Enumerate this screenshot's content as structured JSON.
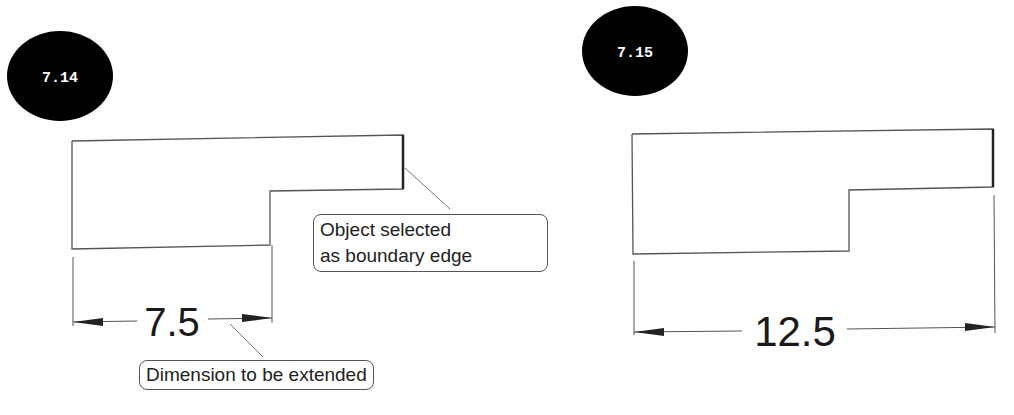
{
  "figures": [
    {
      "id_label": "7.14",
      "dimension_value": "7.5",
      "callouts": [
        {
          "text_lines": [
            "Object selected",
            "as boundary edge"
          ]
        },
        {
          "text_lines": [
            "Dimension to be extended"
          ]
        }
      ]
    },
    {
      "id_label": "7.15",
      "dimension_value": "12.5"
    }
  ],
  "colors": {
    "badge_fill": "#000000",
    "line": "#555555",
    "text": "#1a1a1a"
  }
}
